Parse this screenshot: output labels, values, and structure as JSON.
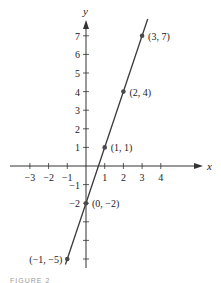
{
  "chart_data": {
    "type": "line",
    "title": "",
    "xlabel": "x",
    "ylabel": "y",
    "xlim": [
      -3.5,
      5.8
    ],
    "ylim": [
      -5.4,
      7.6
    ],
    "x_ticks": [
      -3,
      -2,
      -1,
      1,
      2,
      3,
      4
    ],
    "y_ticks": [
      -5,
      -4,
      -3,
      -2,
      -1,
      1,
      2,
      3,
      4,
      5,
      6,
      7
    ],
    "x_tick_labels": [
      "−3",
      "−2",
      "−1",
      "1",
      "2",
      "3",
      "4"
    ],
    "y_tick_labels": [
      "",
      "",
      "",
      "−2",
      "−1",
      "1",
      "2",
      "3",
      "4",
      "5",
      "6",
      "7"
    ],
    "grid": false,
    "series": [
      {
        "name": "y = 3x − 2",
        "line_extent": [
          [
            -1.1,
            -5.3
          ],
          [
            3.3,
            7.9
          ]
        ],
        "points": [
          {
            "x": -1,
            "y": -5,
            "label": "(−1, −5)"
          },
          {
            "x": 0,
            "y": -2,
            "label": "(0, −2)"
          },
          {
            "x": 1,
            "y": 1,
            "label": "(1, 1)"
          },
          {
            "x": 2,
            "y": 4,
            "label": "(2, 4)"
          },
          {
            "x": 3,
            "y": 7,
            "label": "(3, 7)"
          }
        ]
      }
    ],
    "colors": {
      "axis": "#333333",
      "line": "#3a3a3a",
      "point": "#4a4a4a",
      "text": "#222222"
    }
  },
  "caption": "FIGURE 2"
}
